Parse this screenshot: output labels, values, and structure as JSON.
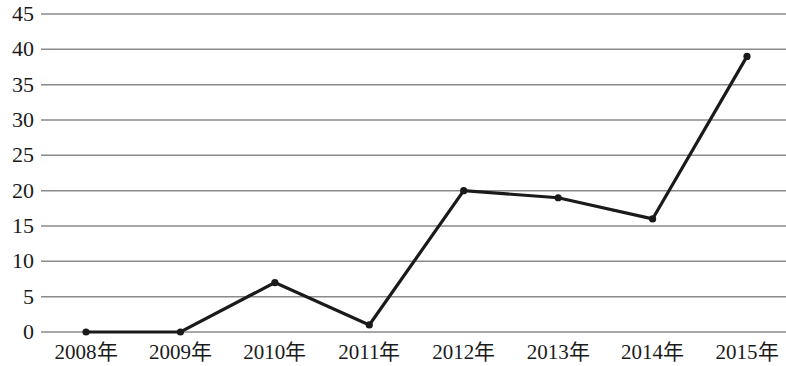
{
  "chart_data": {
    "type": "line",
    "title": "",
    "subtitle": "",
    "xlabel": "",
    "ylabel": "",
    "categories": [
      "2008年",
      "2009年",
      "2010年",
      "2011年",
      "2012年",
      "2013年",
      "2014年",
      "2015年"
    ],
    "values": [
      0,
      0,
      7,
      1,
      20,
      19,
      16,
      39
    ],
    "series": [
      {
        "name": "",
        "values": [
          0,
          0,
          7,
          1,
          20,
          19,
          16,
          39
        ]
      }
    ],
    "ylim": [
      0,
      45
    ],
    "xlim": [
      0,
      7
    ],
    "y_ticks": [
      0,
      5,
      10,
      15,
      20,
      25,
      30,
      35,
      40,
      45
    ],
    "y_tick_labels": [
      "0",
      "5",
      "10",
      "15",
      "20",
      "25",
      "30",
      "35",
      "40",
      "45"
    ],
    "x_tick_labels": [
      "2008年",
      "2009年",
      "2010年",
      "2011年",
      "2012年",
      "2013年",
      "2014年",
      "2015年"
    ],
    "grid": "horizontal",
    "legend": "none",
    "annotations": [],
    "markers": "filled-circle",
    "colors": {
      "line": "#1a1a1a",
      "marker": "#1a1a1a",
      "gridline": "#8a8a8a",
      "axis": "#8a8a8a",
      "background": "#ffffff",
      "text": "#1a1a1a"
    }
  }
}
